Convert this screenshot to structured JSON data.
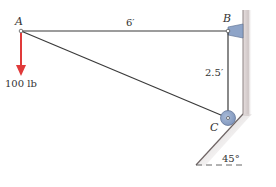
{
  "diagram": {
    "type": "statics-truss-frame",
    "points": {
      "A": {
        "label": "A",
        "x": 21,
        "y": 31
      },
      "B": {
        "label": "B",
        "x": 228,
        "y": 31
      },
      "C": {
        "label": "C",
        "x": 228,
        "y": 118
      }
    },
    "members": [
      {
        "from": "A",
        "to": "B"
      },
      {
        "from": "B",
        "to": "C"
      },
      {
        "from": "A",
        "to": "C"
      }
    ],
    "load": {
      "at": "A",
      "label": "100 lb",
      "direction": "down",
      "color": "#e03a3a"
    },
    "dimensions": {
      "AB": "6′",
      "BC": "2.5′"
    },
    "incline": {
      "angle_label": "45°"
    },
    "supports": {
      "B": "pin bracket on wall",
      "C": "roller on 45° incline"
    },
    "colors": {
      "member": "#3a3a3a",
      "load": "#e03a3a",
      "support_fill": "#8ea4c8",
      "wall": "#d8d0d0"
    }
  }
}
